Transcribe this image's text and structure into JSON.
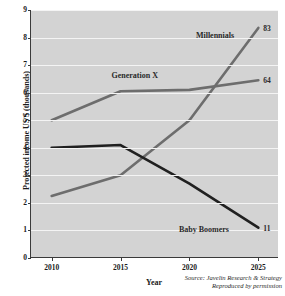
{
  "chart_data": {
    "type": "line",
    "title": "",
    "xlabel": "Year",
    "ylabel": "Projected income US $ (thousands)",
    "x": [
      2010,
      2015,
      2020,
      2025
    ],
    "xtick_labels": [
      "2010",
      "2015",
      "2020",
      "2025"
    ],
    "ytick_labels": [
      "0",
      "1",
      "2",
      "3",
      "4",
      "5",
      "6",
      "7",
      "8",
      "9"
    ],
    "xlim": [
      2008.5,
      2026.5
    ],
    "ylim": [
      0,
      9
    ],
    "grid": "horizontal",
    "legend": "inline-labels",
    "plot_background": "#d3d3d3",
    "gridline_color": "#f4f4f4",
    "series": [
      {
        "name": "Millennials",
        "color": "#6d6d6d",
        "values": [
          2.25,
          3.0,
          5.0,
          8.35
        ],
        "end_value_label": "83",
        "label_x_pct": 74.5,
        "label_y_pct": 10.0
      },
      {
        "name": "Generation X",
        "color": "#6d6d6d",
        "values": [
          5.0,
          6.05,
          6.1,
          6.45
        ],
        "end_value_label": "64",
        "label_x_pct": 42.0,
        "label_y_pct": 26.5
      },
      {
        "name": "Baby Boomers",
        "color": "#202020",
        "values": [
          4.0,
          4.1,
          2.7,
          1.1
        ],
        "end_value_label": "11",
        "label_x_pct": 70.0,
        "label_y_pct": 88.5
      }
    ]
  },
  "credit": {
    "line1": "Source: Javelin Research & Strategy",
    "line2": "Reproduced by permission"
  }
}
